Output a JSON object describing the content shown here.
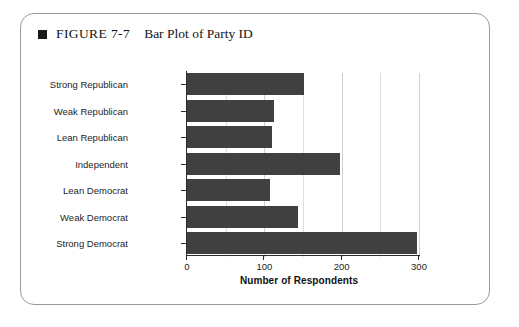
{
  "figure": {
    "marker_icon": "black-square-bullet",
    "label": "FIGURE 7-7",
    "title": "Bar Plot of Party ID"
  },
  "chart_data": {
    "type": "bar",
    "orientation": "horizontal",
    "title": "Bar Plot of Party ID",
    "xlabel": "Number of Respondents",
    "ylabel": "",
    "categories": [
      "Strong Republican",
      "Weak Republican",
      "Lean Republican",
      "Independent",
      "Lean Democrat",
      "Weak Democrat",
      "Strong Democrat"
    ],
    "values": [
      151,
      113,
      110,
      198,
      107,
      143,
      297
    ],
    "xlim": [
      0,
      300
    ],
    "xticks": [
      0,
      100,
      200,
      300
    ],
    "xtick_labels": [
      "0",
      "100",
      "200",
      "300"
    ],
    "grid": true,
    "grid_axis": "x",
    "minor_gridlines": [
      50,
      150,
      250
    ],
    "legend": null,
    "bar_color": "#404040",
    "gridline_color": "#d5d5d5",
    "axis_color": "#2b2b2b",
    "background": "#ffffff"
  }
}
